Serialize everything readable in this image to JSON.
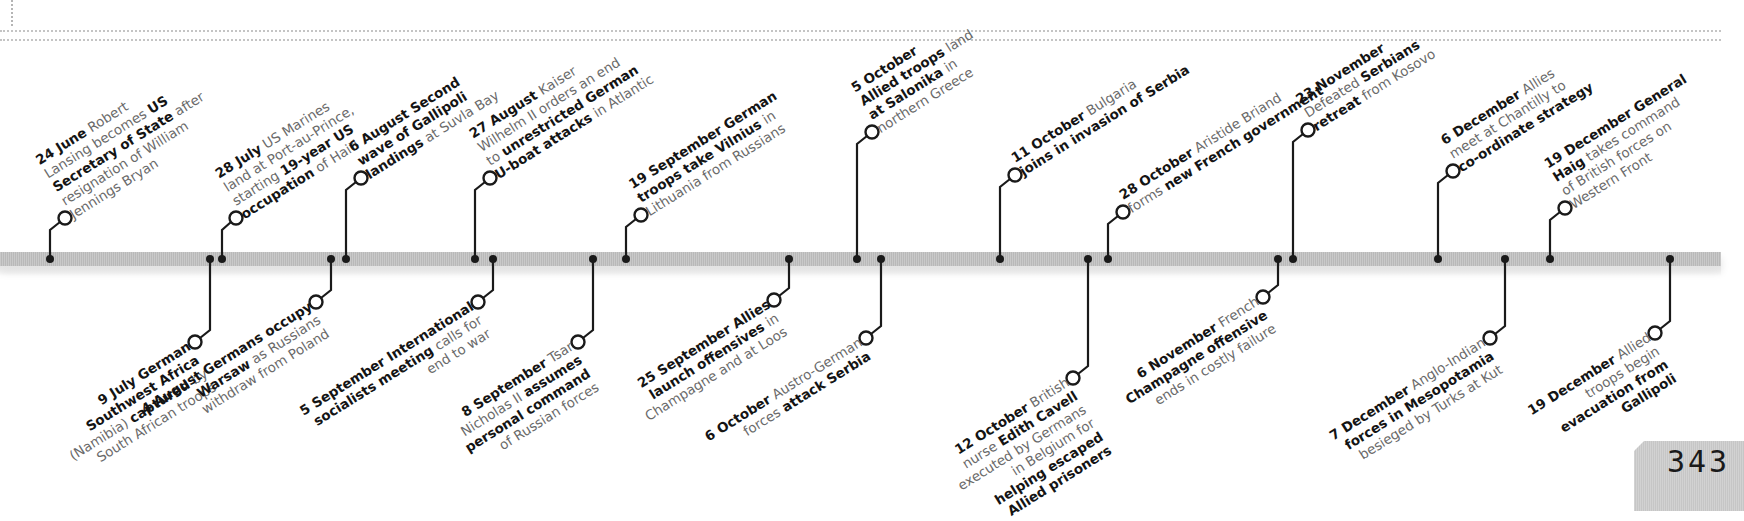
{
  "page": {
    "number": "343"
  },
  "colors": {
    "line": "#1a1a1a",
    "bar": "#c2c2c2",
    "text_bold": "#141414",
    "text_light": "#6a6a6a"
  },
  "events_top": [
    {
      "date": "24 June",
      "parts": [
        [
          "t",
          " Robert"
        ],
        [
          "br"
        ],
        [
          "t",
          "Lansing becomes "
        ],
        [
          "b",
          "US"
        ],
        [
          "br"
        ],
        [
          "b",
          "Secretary of State"
        ],
        [
          "t",
          " after"
        ],
        [
          "br"
        ],
        [
          "t",
          "resignation of William"
        ],
        [
          "br"
        ],
        [
          "t",
          "Jennings Bryan"
        ]
      ],
      "dot_x": 50,
      "cx": 65,
      "cy": 218
    },
    {
      "date": "28 July",
      "parts": [
        [
          "t",
          " US Marines"
        ],
        [
          "br"
        ],
        [
          "t",
          "land at Port-au-Prince,"
        ],
        [
          "br"
        ],
        [
          "t",
          "starting "
        ],
        [
          "b",
          "19-year US"
        ],
        [
          "br"
        ],
        [
          "b",
          "occupation"
        ],
        [
          "t",
          " of Haiti"
        ]
      ],
      "dot_x": 222,
      "cx": 236,
      "cy": 218
    },
    {
      "date": "6 August",
      "parts": [
        [
          "b",
          " Second"
        ],
        [
          "br"
        ],
        [
          "b",
          "wave of Gallipoli"
        ],
        [
          "br"
        ],
        [
          "b",
          "landings"
        ],
        [
          "t",
          " at Suvla Bay"
        ]
      ],
      "dot_x": 346,
      "cx": 361,
      "cy": 178
    },
    {
      "date": "27 August",
      "parts": [
        [
          "t",
          " Kaiser"
        ],
        [
          "br"
        ],
        [
          "t",
          "Wilhelm II orders an end"
        ],
        [
          "br"
        ],
        [
          "t",
          "to "
        ],
        [
          "b",
          "unrestricted German"
        ],
        [
          "br"
        ],
        [
          "b",
          "U-boat attacks"
        ],
        [
          "t",
          " in Atlantic"
        ]
      ],
      "dot_x": 475,
      "cx": 490,
      "cy": 178
    },
    {
      "date": "19 September",
      "parts": [
        [
          "b",
          " German"
        ],
        [
          "br"
        ],
        [
          "b",
          "troops take Vilnius"
        ],
        [
          "t",
          " in"
        ],
        [
          "br"
        ],
        [
          "t",
          "Lithuania from Russians"
        ]
      ],
      "dot_x": 626,
      "cx": 641,
      "cy": 215
    },
    {
      "date": "5 October",
      "parts": [
        [
          "br"
        ],
        [
          "b",
          "Allied troops"
        ],
        [
          "t",
          " land"
        ],
        [
          "br"
        ],
        [
          "b",
          "at Salonika"
        ],
        [
          "t",
          " in"
        ],
        [
          "br"
        ],
        [
          "t",
          "northern Greece"
        ]
      ],
      "dot_x": 857,
      "cx": 872,
      "cy": 132
    },
    {
      "date": "11 October",
      "parts": [
        [
          "t",
          " Bulgaria"
        ],
        [
          "br"
        ],
        [
          "b",
          "joins in invasion of Serbia"
        ]
      ],
      "dot_x": 1000,
      "cx": 1015,
      "cy": 175
    },
    {
      "date": "28 October",
      "parts": [
        [
          "t",
          " Aristide Briand"
        ],
        [
          "br"
        ],
        [
          "t",
          "forms "
        ],
        [
          "b",
          "new French government"
        ]
      ],
      "dot_x": 1108,
      "cx": 1123,
      "cy": 212
    },
    {
      "date": "23 November",
      "parts": [
        [
          "br"
        ],
        [
          "t",
          "Defeated "
        ],
        [
          "b",
          "Serbians"
        ],
        [
          "br"
        ],
        [
          "b",
          "retreat"
        ],
        [
          "t",
          " from Kosovo"
        ]
      ],
      "dot_x": 1293,
      "cx": 1308,
      "cy": 130
    },
    {
      "date": "6 December",
      "parts": [
        [
          "t",
          " Allies"
        ],
        [
          "br"
        ],
        [
          "t",
          "meet at Chantilly to"
        ],
        [
          "br"
        ],
        [
          "b",
          "co-ordinate strategy"
        ]
      ],
      "dot_x": 1438,
      "cx": 1453,
      "cy": 171
    },
    {
      "date": "19 December",
      "parts": [
        [
          "b",
          " General"
        ],
        [
          "br"
        ],
        [
          "b",
          "Haig"
        ],
        [
          "t",
          " takes command"
        ],
        [
          "br"
        ],
        [
          "t",
          "of British forces on"
        ],
        [
          "br"
        ],
        [
          "t",
          "Western Front"
        ]
      ],
      "dot_x": 1550,
      "cx": 1565,
      "cy": 208
    }
  ],
  "events_bottom": [
    {
      "date": "9 July",
      "parts": [
        [
          "b",
          " German"
        ],
        [
          "br"
        ],
        [
          "b",
          "Southwest Africa"
        ],
        [
          "br"
        ],
        [
          "t",
          "(Namibia) "
        ],
        [
          "b",
          "captured"
        ],
        [
          "t",
          " by"
        ],
        [
          "br"
        ],
        [
          "t",
          "South African troops"
        ]
      ],
      "dot_x": 210,
      "cx": 195,
      "cy": 342
    },
    {
      "date": "4 August",
      "parts": [
        [
          "b",
          " Germans occupy"
        ],
        [
          "br"
        ],
        [
          "b",
          "Warsaw"
        ],
        [
          "t",
          " as Russians"
        ],
        [
          "br"
        ],
        [
          "t",
          "withdraw from Poland"
        ]
      ],
      "dot_x": 331,
      "cx": 316,
      "cy": 302
    },
    {
      "date": "5 September",
      "parts": [
        [
          "b",
          " International"
        ],
        [
          "br"
        ],
        [
          "b",
          "socialists meeting"
        ],
        [
          "t",
          " calls for"
        ],
        [
          "br"
        ],
        [
          "t",
          "end to war"
        ]
      ],
      "dot_x": 493,
      "cx": 478,
      "cy": 302
    },
    {
      "date": "8 September",
      "parts": [
        [
          "t",
          " Tsar"
        ],
        [
          "br"
        ],
        [
          "t",
          "Nicholas II "
        ],
        [
          "b",
          "assumes"
        ],
        [
          "br"
        ],
        [
          "b",
          "personal command"
        ],
        [
          "br"
        ],
        [
          "t",
          "of Russian forces"
        ]
      ],
      "dot_x": 593,
      "cx": 578,
      "cy": 342
    },
    {
      "date": "25 September",
      "parts": [
        [
          "b",
          " Allies"
        ],
        [
          "br"
        ],
        [
          "b",
          "launch offensives"
        ],
        [
          "t",
          " in"
        ],
        [
          "br"
        ],
        [
          "t",
          "Champagne and at Loos"
        ]
      ],
      "dot_x": 789,
      "cx": 774,
      "cy": 300
    },
    {
      "date": "6 October",
      "parts": [
        [
          "t",
          " Austro-German"
        ],
        [
          "br"
        ],
        [
          "t",
          "forces "
        ],
        [
          "b",
          "attack Serbia"
        ]
      ],
      "dot_x": 881,
      "cx": 866,
      "cy": 338
    },
    {
      "date": "12 October",
      "parts": [
        [
          "t",
          " British"
        ],
        [
          "br"
        ],
        [
          "t",
          "nurse "
        ],
        [
          "b",
          "Edith Cavell"
        ],
        [
          "br"
        ],
        [
          "t",
          "executed by Germans"
        ],
        [
          "br"
        ],
        [
          "t",
          "in Belgium for"
        ],
        [
          "br"
        ],
        [
          "b",
          "helping escaped"
        ],
        [
          "br"
        ],
        [
          "b",
          "Allied prisoners"
        ]
      ],
      "dot_x": 1088,
      "cx": 1073,
      "cy": 378
    },
    {
      "date": "6 November",
      "parts": [
        [
          "t",
          " French"
        ],
        [
          "br"
        ],
        [
          "b",
          "Champagne offensive"
        ],
        [
          "br"
        ],
        [
          "t",
          "ends in costly failure"
        ]
      ],
      "dot_x": 1278,
      "cx": 1263,
      "cy": 297
    },
    {
      "date": "7 December",
      "parts": [
        [
          "t",
          " Anglo-Indian"
        ],
        [
          "br"
        ],
        [
          "b",
          "forces in Mesopotamia"
        ],
        [
          "br"
        ],
        [
          "t",
          "besieged by Turks at Kut"
        ]
      ],
      "dot_x": 1505,
      "cx": 1490,
      "cy": 338
    },
    {
      "date": "19 December",
      "parts": [
        [
          "t",
          " Allied"
        ],
        [
          "br"
        ],
        [
          "t",
          "troops begin"
        ],
        [
          "br"
        ],
        [
          "b",
          "evacuation from"
        ],
        [
          "br"
        ],
        [
          "b",
          "Gallipoli"
        ]
      ],
      "dot_x": 1670,
      "cx": 1655,
      "cy": 333
    }
  ]
}
